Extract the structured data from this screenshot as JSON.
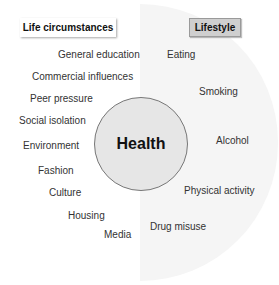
{
  "diagram": {
    "center": {
      "label": "Health"
    },
    "categories": {
      "left": {
        "label": "Life circumstances"
      },
      "right": {
        "label": "Lifestyle"
      }
    },
    "life_circumstances": [
      "General education",
      "Commercial influences",
      "Peer pressure",
      "Social isolation",
      "Environment",
      "Fashion",
      "Culture",
      "Housing",
      "Media"
    ],
    "lifestyle": [
      "Eating",
      "Smoking",
      "Alcohol",
      "Physical activity",
      "Drug misuse"
    ],
    "colors": {
      "circle_fill": "#e6e6e6",
      "lifestyle_box": "#cfcfcf",
      "halfdisc": "#f5f5f5"
    }
  }
}
